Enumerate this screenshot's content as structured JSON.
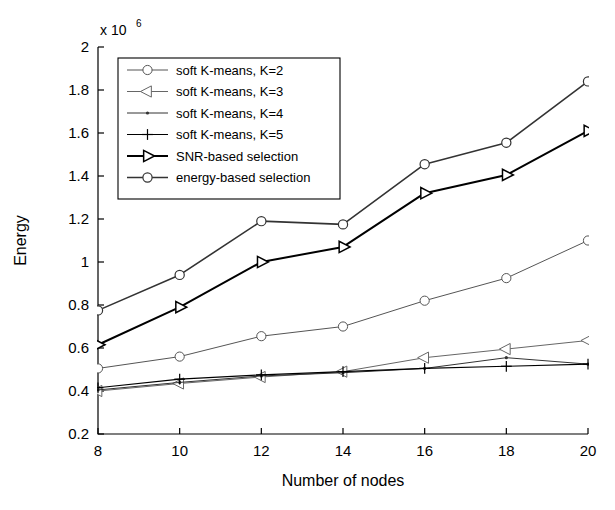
{
  "chart_data": {
    "type": "line",
    "title": "",
    "xlabel": "Number of nodes",
    "ylabel": "Energy",
    "x": [
      8,
      10,
      12,
      14,
      16,
      18,
      20
    ],
    "xtick_labels": [
      "8",
      "10",
      "12",
      "14",
      "16",
      "18",
      "20"
    ],
    "ytick_labels": [
      "0.2",
      "0.4",
      "0.6",
      "0.8",
      "1",
      "1.2",
      "1.4",
      "1.6",
      "1.8",
      "2"
    ],
    "ytick_values": [
      0.2,
      0.4,
      0.6,
      0.8,
      1.0,
      1.2,
      1.4,
      1.6,
      1.8,
      2.0
    ],
    "xlim": [
      8,
      20
    ],
    "ylim": [
      0.2,
      2.0
    ],
    "y_exponent_label": "x 10",
    "y_exponent_power": "6",
    "y_scale_factor": 1000000,
    "grid": false,
    "legend_position": "upper left",
    "series": [
      {
        "name": "soft K-means, K=2",
        "marker": "circle",
        "color": "#555555",
        "linewidth": 1.0,
        "values": [
          0.505,
          0.56,
          0.655,
          0.7,
          0.82,
          0.925,
          1.1
        ]
      },
      {
        "name": "soft K-means, K=3",
        "marker": "triangle-left",
        "color": "#666666",
        "linewidth": 1.0,
        "values": [
          0.4,
          0.435,
          0.465,
          0.49,
          0.555,
          0.595,
          0.635
        ]
      },
      {
        "name": "soft K-means, K=4",
        "marker": "dot",
        "color": "#333333",
        "linewidth": 1.0,
        "values": [
          0.405,
          0.44,
          0.47,
          0.485,
          0.505,
          0.555,
          0.525
        ]
      },
      {
        "name": "soft K-means, K=5",
        "marker": "plus",
        "color": "#000000",
        "linewidth": 1.2,
        "values": [
          0.415,
          0.455,
          0.475,
          0.49,
          0.505,
          0.515,
          0.525
        ]
      },
      {
        "name": "SNR-based selection",
        "marker": "triangle-right",
        "color": "#000000",
        "linewidth": 2.0,
        "values": [
          0.615,
          0.79,
          1.0,
          1.07,
          1.32,
          1.405,
          1.61
        ]
      },
      {
        "name": "energy-based selection",
        "marker": "circle",
        "color": "#333333",
        "linewidth": 1.6,
        "values": [
          0.775,
          0.94,
          1.19,
          1.175,
          1.455,
          1.555,
          1.84
        ]
      }
    ]
  }
}
